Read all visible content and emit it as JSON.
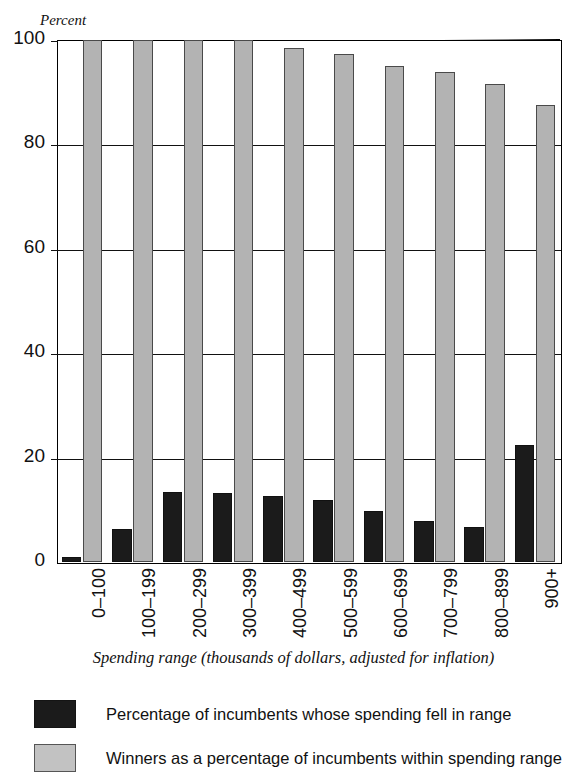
{
  "scan_remnant": "",
  "chart_data": {
    "type": "bar",
    "title": "",
    "ylabel": "Percent",
    "xlabel": "Spending range (thousands of dollars, adjusted for inflation)",
    "ylim": [
      0,
      100
    ],
    "yticks": [
      0,
      20,
      40,
      60,
      80,
      100
    ],
    "ytick_labels": [
      "0",
      "20",
      "40",
      "60",
      "80",
      "100"
    ],
    "grid": true,
    "legend_position": "below",
    "categories": [
      "0–100",
      "100–199",
      "200–299",
      "300–399",
      "400–499",
      "500–599",
      "600–699",
      "700–799",
      "800–899",
      "900+"
    ],
    "series": [
      {
        "name": "Percentage of incumbents whose spending fell in range",
        "color": "#1b1b1b",
        "values": [
          0.9,
          6.4,
          13.5,
          13.2,
          12.7,
          11.8,
          9.7,
          7.8,
          6.8,
          22.5
        ]
      },
      {
        "name": "Winners as a percentage of incumbents within spending range",
        "color": "#b3b3b3",
        "values": [
          100,
          100,
          100,
          100,
          98.5,
          97.3,
          95.1,
          93.8,
          91.6,
          87.5
        ]
      }
    ]
  },
  "legend": {
    "items": [
      {
        "swatch": "dark",
        "label": "Percentage of incumbents whose spending fell in range"
      },
      {
        "swatch": "gray",
        "label": "Winners as a percentage of incumbents within spending range"
      }
    ]
  }
}
